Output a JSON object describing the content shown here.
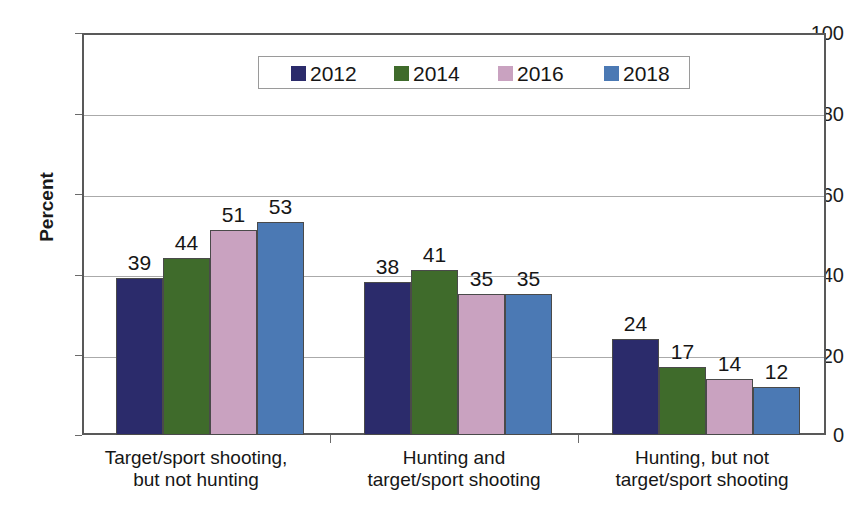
{
  "chart_data": {
    "type": "bar",
    "title": "",
    "subtitle": "",
    "xlabel": "",
    "ylabel": "Percent",
    "ylim": [
      0,
      100
    ],
    "yticks": [
      0,
      20,
      40,
      60,
      80,
      100
    ],
    "grid": true,
    "legend_position": "top-center-inside",
    "categories": [
      "Target/sport shooting,\nbut not hunting",
      "Hunting and\ntarget/sport shooting",
      "Hunting, but not\ntarget/sport shooting"
    ],
    "category_lines": [
      [
        "Target/sport shooting,",
        "but not hunting"
      ],
      [
        "Hunting and",
        "target/sport shooting"
      ],
      [
        "Hunting, but not",
        "target/sport shooting"
      ]
    ],
    "series": [
      {
        "name": "2012",
        "color": "#2b2b6b",
        "values": [
          39,
          38,
          24
        ]
      },
      {
        "name": "2014",
        "color": "#3f6b2b",
        "values": [
          44,
          41,
          17
        ]
      },
      {
        "name": "2016",
        "color": "#c9a2c0",
        "values": [
          51,
          35,
          14
        ]
      },
      {
        "name": "2018",
        "color": "#4b79b4",
        "values": [
          53,
          35,
          12
        ]
      }
    ],
    "data_labels": [
      [
        39,
        44,
        51,
        53
      ],
      [
        38,
        41,
        35,
        35
      ],
      [
        24,
        17,
        14,
        12
      ]
    ]
  },
  "axis": {
    "y_title": "Percent",
    "y_tick_labels": [
      "100",
      "80",
      "60",
      "40",
      "20",
      "0"
    ]
  },
  "legend": {
    "entries": [
      {
        "label": "2012",
        "color": "#2b2b6b"
      },
      {
        "label": "2014",
        "color": "#3f6b2b"
      },
      {
        "label": "2016",
        "color": "#c9a2c0"
      },
      {
        "label": "2018",
        "color": "#4b79b4"
      }
    ]
  }
}
